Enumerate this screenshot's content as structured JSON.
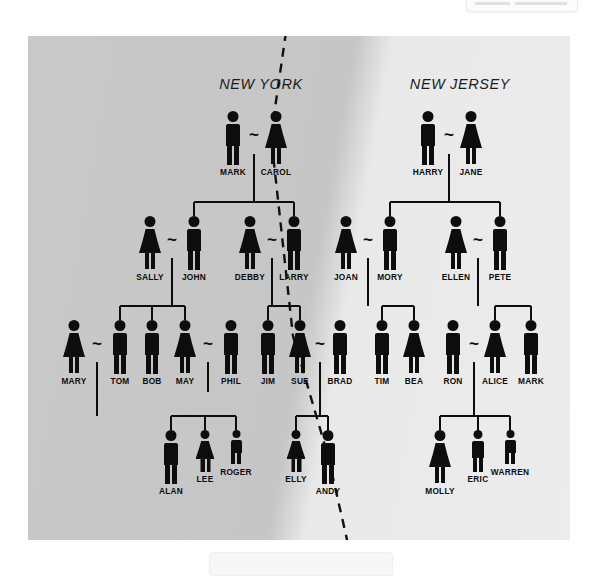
{
  "diagram": {
    "regions": [
      {
        "id": "new-york",
        "label": "NEW YORK",
        "x": 233,
        "y": 40
      },
      {
        "id": "new-jersey",
        "label": "NEW JERSEY",
        "x": 432,
        "y": 40
      }
    ],
    "colors": {
      "figure": "#0d0d0d",
      "panel_left": "#c8c8c8",
      "panel_right": "#ececec",
      "divider": "#111111",
      "label_text": "#1b1b1b"
    },
    "divider": {
      "type": "dashed-line",
      "points": [
        [
          258,
          -4
        ],
        [
          243,
          100
        ],
        [
          265,
          300
        ],
        [
          300,
          420
        ],
        [
          320,
          508
        ]
      ],
      "dash": "9 7",
      "width": 2.4
    },
    "generations": [
      {
        "id": "generation-1",
        "row_y": 75,
        "people": [
          {
            "name": "MARK",
            "sex": "male",
            "size": "adult",
            "x": 205
          },
          {
            "name": "CAROL",
            "sex": "female",
            "size": "adult",
            "x": 248
          },
          {
            "name": "HARRY",
            "sex": "male",
            "size": "adult",
            "x": 400
          },
          {
            "name": "JANE",
            "sex": "female",
            "size": "adult",
            "x": 443
          }
        ],
        "marriages": [
          {
            "left": "MARK",
            "right": "CAROL",
            "x": 226,
            "y": 98
          },
          {
            "left": "HARRY",
            "right": "JANE",
            "x": 421,
            "y": 98
          }
        ]
      },
      {
        "id": "generation-2",
        "row_y": 180,
        "people": [
          {
            "name": "SALLY",
            "sex": "female",
            "size": "adult",
            "x": 122
          },
          {
            "name": "JOHN",
            "sex": "male",
            "size": "adult",
            "x": 166
          },
          {
            "name": "DEBBY",
            "sex": "female",
            "size": "adult",
            "x": 222
          },
          {
            "name": "LARRY",
            "sex": "male",
            "size": "adult",
            "x": 266
          },
          {
            "name": "JOAN",
            "sex": "female",
            "size": "adult",
            "x": 318
          },
          {
            "name": "MORY",
            "sex": "male",
            "size": "adult",
            "x": 362
          },
          {
            "name": "ELLEN",
            "sex": "female",
            "size": "adult",
            "x": 428
          },
          {
            "name": "PETE",
            "sex": "male",
            "size": "adult",
            "x": 472
          }
        ],
        "marriages": [
          {
            "left": "SALLY",
            "right": "JOHN",
            "x": 144,
            "y": 203
          },
          {
            "left": "DEBBY",
            "right": "LARRY",
            "x": 244,
            "y": 203
          },
          {
            "left": "JOAN",
            "right": "MORY",
            "x": 340,
            "y": 203
          },
          {
            "left": "ELLEN",
            "right": "PETE",
            "x": 450,
            "y": 203
          }
        ]
      },
      {
        "id": "generation-3",
        "row_y": 284,
        "people": [
          {
            "name": "MARY",
            "sex": "female",
            "size": "adult",
            "x": 46
          },
          {
            "name": "TOM",
            "sex": "male",
            "size": "adult",
            "x": 92
          },
          {
            "name": "BOB",
            "sex": "male",
            "size": "adult",
            "x": 124
          },
          {
            "name": "MAY",
            "sex": "female",
            "size": "adult",
            "x": 157
          },
          {
            "name": "PHIL",
            "sex": "male",
            "size": "adult",
            "x": 203
          },
          {
            "name": "JIM",
            "sex": "male",
            "size": "adult",
            "x": 240
          },
          {
            "name": "SUE",
            "sex": "female",
            "size": "adult",
            "x": 272
          },
          {
            "name": "BRAD",
            "sex": "male",
            "size": "adult",
            "x": 312
          },
          {
            "name": "TIM",
            "sex": "male",
            "size": "adult",
            "x": 354
          },
          {
            "name": "BEA",
            "sex": "female",
            "size": "adult",
            "x": 386
          },
          {
            "name": "RON",
            "sex": "male",
            "size": "adult",
            "x": 425
          },
          {
            "name": "ALICE",
            "sex": "female",
            "size": "adult",
            "x": 467
          },
          {
            "name": "MARK",
            "sex": "male",
            "size": "adult",
            "x": 503
          }
        ],
        "marriages": [
          {
            "left": "MARY",
            "right": "TOM",
            "x": 69,
            "y": 307
          },
          {
            "left": "MAY",
            "right": "PHIL",
            "x": 180,
            "y": 307
          },
          {
            "left": "SUE",
            "right": "BRAD",
            "x": 292,
            "y": 307
          },
          {
            "left": "RON",
            "right": "ALICE",
            "x": 446,
            "y": 307
          }
        ]
      },
      {
        "id": "generation-4",
        "row_y": 394,
        "people": [
          {
            "name": "ALAN",
            "sex": "male",
            "size": "adult",
            "x": 143
          },
          {
            "name": "LEE",
            "sex": "female",
            "size": "child",
            "x": 177
          },
          {
            "name": "ROGER",
            "sex": "male",
            "size": "small",
            "x": 208
          },
          {
            "name": "ELLY",
            "sex": "female",
            "size": "child",
            "x": 268
          },
          {
            "name": "ANDY",
            "sex": "male",
            "size": "adult",
            "x": 300
          },
          {
            "name": "MOLLY",
            "sex": "female",
            "size": "adult",
            "x": 412
          },
          {
            "name": "ERIC",
            "sex": "male",
            "size": "child",
            "x": 450
          },
          {
            "name": "WARREN",
            "sex": "male",
            "size": "small",
            "x": 482
          }
        ],
        "marriages": []
      }
    ],
    "descent_links": [
      {
        "parents": [
          "MARK",
          "CAROL"
        ],
        "children": [
          "JOHN",
          "LARRY"
        ]
      },
      {
        "parents": [
          "HARRY",
          "JANE"
        ],
        "children": [
          "MORY",
          "ELLEN"
        ]
      },
      {
        "parents": [
          "SALLY",
          "JOHN"
        ],
        "children": [
          "TOM",
          "BOB",
          "MAY"
        ]
      },
      {
        "parents": [
          "DEBBY",
          "LARRY"
        ],
        "children": [
          "JIM",
          "SUE"
        ]
      },
      {
        "parents": [
          "JOAN",
          "MORY"
        ],
        "children": [
          "TIM",
          "BEA"
        ]
      },
      {
        "parents": [
          "ELLEN",
          "PETE"
        ],
        "children": [
          "ALICE",
          "MARK"
        ]
      },
      {
        "parents": [
          "MARY",
          "TOM"
        ],
        "children": [
          "ALAN",
          "LEE",
          "ROGER"
        ]
      },
      {
        "parents": [
          "SUE",
          "BRAD"
        ],
        "children": [
          "ELLY",
          "ANDY"
        ]
      },
      {
        "parents": [
          "RON",
          "ALICE"
        ],
        "children": [
          "MOLLY",
          "ERIC",
          "WARREN"
        ]
      }
    ],
    "edges": {
      "g1_to_g2": [
        {
          "stem_x": 226,
          "stem_top": 148,
          "stem_bottom": 166,
          "bar_y": 166,
          "bar_left": 166,
          "bar_right": 266,
          "drops": [
            {
              "x": 166,
              "to": 180
            },
            {
              "x": 266,
              "to": 180
            }
          ]
        },
        {
          "stem_x": 421,
          "stem_top": 148,
          "stem_bottom": 166,
          "bar_y": 166,
          "bar_left": 362,
          "bar_right": 472,
          "drops": [
            {
              "x": 362,
              "to": 180
            },
            {
              "x": 472,
              "to": 180
            }
          ]
        }
      ],
      "g2_to_g3": [
        {
          "stem_x": 144,
          "stem_top": 252,
          "stem_bottom": 270,
          "bar_y": 270,
          "bar_left": 92,
          "bar_right": 157,
          "drops": [
            {
              "x": 92,
              "to": 284
            },
            {
              "x": 124,
              "to": 284
            },
            {
              "x": 157,
              "to": 284
            }
          ]
        },
        {
          "stem_x": 244,
          "stem_top": 252,
          "stem_bottom": 270,
          "bar_y": 270,
          "bar_left": 240,
          "bar_right": 272,
          "drops": [
            {
              "x": 240,
              "to": 284
            },
            {
              "x": 272,
              "to": 284
            }
          ]
        },
        {
          "stem_x": 340,
          "stem_top": 252,
          "stem_bottom": 270,
          "bar_y": 270,
          "bar_left": 354,
          "bar_right": 386,
          "drops": [
            {
              "x": 354,
              "to": 284
            },
            {
              "x": 386,
              "to": 284
            }
          ]
        },
        {
          "stem_x": 450,
          "stem_top": 252,
          "stem_bottom": 270,
          "bar_y": 270,
          "bar_left": 467,
          "bar_right": 503,
          "drops": [
            {
              "x": 467,
              "to": 284
            },
            {
              "x": 503,
              "to": 284
            }
          ]
        }
      ],
      "g3_to_g4": [
        {
          "stem_x": 69,
          "stem_top": 356,
          "stem_bottom": 380,
          "bar_y": 380,
          "bar_left": 143,
          "bar_right": 208,
          "drops": [
            {
              "x": 143,
              "to": 394
            },
            {
              "x": 177,
              "to": 394
            },
            {
              "x": 208,
              "to": 394
            }
          ]
        },
        {
          "stem_x": 292,
          "stem_top": 356,
          "stem_bottom": 380,
          "bar_y": 380,
          "bar_left": 268,
          "bar_right": 300,
          "drops": [
            {
              "x": 268,
              "to": 394
            },
            {
              "x": 300,
              "to": 394
            }
          ]
        },
        {
          "stem_x": 446,
          "stem_top": 356,
          "stem_bottom": 380,
          "bar_y": 380,
          "bar_left": 412,
          "bar_right": 482,
          "drops": [
            {
              "x": 412,
              "to": 394
            },
            {
              "x": 450,
              "to": 394
            },
            {
              "x": 482,
              "to": 394
            }
          ]
        }
      ],
      "spouse_stems": [
        {
          "x": 226,
          "top": 118,
          "bottom": 148
        },
        {
          "x": 421,
          "top": 118,
          "bottom": 148
        },
        {
          "x": 144,
          "top": 222,
          "bottom": 252
        },
        {
          "x": 244,
          "top": 222,
          "bottom": 252
        },
        {
          "x": 340,
          "top": 222,
          "bottom": 252
        },
        {
          "x": 450,
          "top": 222,
          "bottom": 252
        },
        {
          "x": 69,
          "top": 326,
          "bottom": 356
        },
        {
          "x": 180,
          "top": 326,
          "bottom": 356
        },
        {
          "x": 292,
          "top": 326,
          "bottom": 356
        },
        {
          "x": 446,
          "top": 326,
          "bottom": 356
        }
      ],
      "g3_extra_stem": {
        "x": 69,
        "top": 356,
        "bottom": 380
      }
    }
  }
}
